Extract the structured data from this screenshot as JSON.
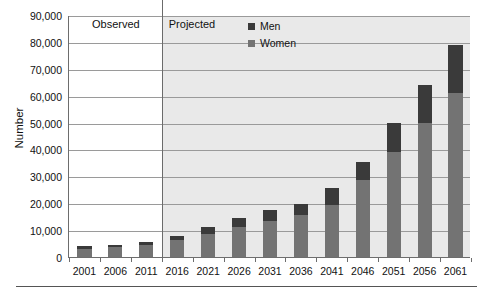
{
  "chart_data": {
    "type": "bar",
    "stacked": true,
    "title": "",
    "subtitle": "",
    "xlabel": "",
    "ylabel": "Number",
    "categories": [
      "2001",
      "2006",
      "2011",
      "2016",
      "2021",
      "2026",
      "2031",
      "2036",
      "2041",
      "2046",
      "2051",
      "2056",
      "2061"
    ],
    "series": [
      {
        "name": "Women",
        "color": "#737373",
        "values": [
          3100,
          3700,
          4600,
          6200,
          8500,
          11000,
          13500,
          15500,
          19500,
          28500,
          39000,
          50000,
          61000
        ]
      },
      {
        "name": "Men",
        "color": "#3a3a3a",
        "values": [
          900,
          900,
          1100,
          1700,
          2600,
          3600,
          4100,
          4200,
          6000,
          7000,
          11000,
          14000,
          18000
        ]
      }
    ],
    "totals": [
      4000,
      4600,
      5700,
      7900,
      11100,
      14600,
      17600,
      19700,
      25500,
      35500,
      50000,
      64000,
      79000
    ],
    "ylim": [
      0,
      90000
    ],
    "ytick_values": [
      0,
      10000,
      20000,
      30000,
      40000,
      50000,
      60000,
      70000,
      80000,
      90000
    ],
    "ytick_labels": [
      "0",
      "10,000",
      "20,000",
      "30,000",
      "40,000",
      "50,000",
      "60,000",
      "70,000",
      "80,000",
      "90,000"
    ],
    "grid": true,
    "legend_position": "top-center",
    "annotations": [
      {
        "text": "Observed",
        "region": "2001-2011",
        "background": "#ffffff"
      },
      {
        "text": "Projected",
        "region": "2016-2061",
        "background": "#e9e9e9"
      }
    ]
  },
  "legend": {
    "entries": [
      {
        "label": "Men",
        "color": "#3a3a3a"
      },
      {
        "label": "Women",
        "color": "#737373"
      }
    ]
  },
  "regions": {
    "observed_label": "Observed",
    "projected_label": "Projected"
  },
  "axis": {
    "y_title": "Number"
  },
  "colors": {
    "men": "#3a3a3a",
    "women": "#737373",
    "projected_bg": "#e9e9e9",
    "observed_bg": "#ffffff",
    "gridline": "#9a9a9a",
    "axis": "#6d6d6d"
  }
}
